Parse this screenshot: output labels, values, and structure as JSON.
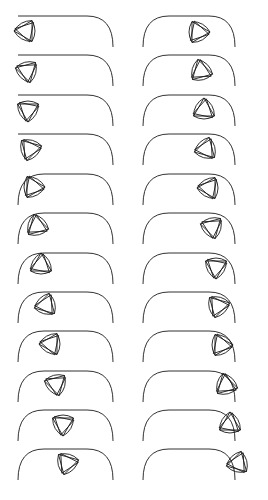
{
  "caption": "· · · ··· · · · · ·",
  "colors": {
    "stroke": "#1a1a1a",
    "background": "#ffffff"
  },
  "track": {
    "height": 31,
    "corner_radius": 26
  },
  "columns": [
    {
      "name": "left",
      "track_x0": 18,
      "track_x1": 113,
      "left_arc": false,
      "frames": [
        {
          "y": 16,
          "cx": 26,
          "cy": 31,
          "r": 12,
          "rot": 180
        },
        {
          "y": 55,
          "cx": 27,
          "cy": 71,
          "r": 12,
          "rot": 195
        },
        {
          "y": 95,
          "cx": 28,
          "cy": 110,
          "r": 12,
          "rot": 210
        },
        {
          "y": 134,
          "cx": 30,
          "cy": 149,
          "r": 12,
          "rot": 225
        },
        {
          "y": 174,
          "cx": 33,
          "cy": 187,
          "r": 12,
          "rot": 240
        },
        {
          "y": 213,
          "cx": 37,
          "cy": 226,
          "r": 12,
          "rot": 255
        },
        {
          "y": 253,
          "cx": 41,
          "cy": 265,
          "r": 12,
          "rot": 270
        },
        {
          "y": 292,
          "cx": 46,
          "cy": 305,
          "r": 12,
          "rot": 285
        },
        {
          "y": 331,
          "cx": 51,
          "cy": 344,
          "r": 12,
          "rot": 300
        },
        {
          "y": 371,
          "cx": 56,
          "cy": 384,
          "r": 12,
          "rot": 315
        },
        {
          "y": 410,
          "cx": 63,
          "cy": 424,
          "r": 12,
          "rot": 330
        },
        {
          "y": 449,
          "cx": 67,
          "cy": 463,
          "r": 12,
          "rot": 345
        }
      ]
    },
    {
      "name": "right",
      "track_x0": 143,
      "track_x1": 235,
      "left_arc": true,
      "frames": [
        {
          "y": 16,
          "cx": 198,
          "cy": 32,
          "r": 12,
          "rot": 0
        },
        {
          "y": 55,
          "cx": 201,
          "cy": 71,
          "r": 12,
          "rot": 15
        },
        {
          "y": 95,
          "cx": 204,
          "cy": 110,
          "r": 12,
          "rot": 30
        },
        {
          "y": 134,
          "cx": 206,
          "cy": 149,
          "r": 12,
          "rot": 45
        },
        {
          "y": 174,
          "cx": 209,
          "cy": 188,
          "r": 12,
          "rot": 60
        },
        {
          "y": 213,
          "cx": 212,
          "cy": 227,
          "r": 12,
          "rot": 75
        },
        {
          "y": 253,
          "cx": 216,
          "cy": 267,
          "r": 12,
          "rot": 90
        },
        {
          "y": 292,
          "cx": 218,
          "cy": 306,
          "r": 12,
          "rot": 105
        },
        {
          "y": 331,
          "cx": 221,
          "cy": 345,
          "r": 12,
          "rot": 120
        },
        {
          "y": 371,
          "cx": 226,
          "cy": 385,
          "r": 12,
          "rot": 135
        },
        {
          "y": 410,
          "cx": 230,
          "cy": 424,
          "r": 12,
          "rot": 150
        },
        {
          "y": 449,
          "cx": 238,
          "cy": 463,
          "r": 12,
          "rot": 165
        }
      ]
    }
  ]
}
